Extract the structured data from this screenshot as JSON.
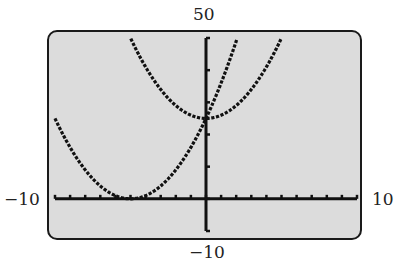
{
  "window": {
    "xmin": "-10",
    "xmax": "10",
    "ymin": "-10",
    "ymax": "50"
  },
  "chart_data": {
    "type": "line",
    "title": "",
    "xlabel": "",
    "ylabel": "",
    "xlim": [
      -10,
      10
    ],
    "ylim": [
      -10,
      50
    ],
    "grid": false,
    "x_tick_spacing": 1,
    "y_tick_spacing": 10,
    "series": [
      {
        "name": "y = (x + 5)^2",
        "x": [
          -10,
          -9,
          -8,
          -7,
          -6,
          -5,
          -4,
          -3,
          -2,
          -1,
          0,
          1,
          2,
          2.07
        ],
        "values": [
          25,
          16,
          9,
          4,
          1,
          0,
          1,
          4,
          9,
          16,
          25,
          36,
          49,
          50
        ]
      },
      {
        "name": "y = x^2 + 25",
        "x": [
          -5,
          -4,
          -3,
          -2,
          -1,
          0,
          1,
          2,
          3,
          4,
          5
        ],
        "values": [
          50,
          41,
          34,
          29,
          26,
          25,
          26,
          29,
          34,
          41,
          50
        ]
      }
    ],
    "legend": null,
    "annotations": [
      "50",
      "-10",
      "-10",
      "10"
    ]
  }
}
